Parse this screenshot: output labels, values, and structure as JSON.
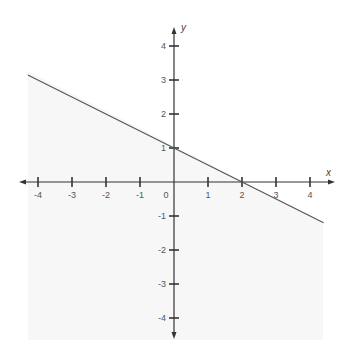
{
  "chart_data": {
    "type": "line",
    "title": "",
    "xlabel": "x",
    "ylabel": "y",
    "xlim": [
      -4.5,
      4.5
    ],
    "ylim": [
      -4.5,
      4.5
    ],
    "grid": false,
    "x_ticks": [
      "-4",
      "-3",
      "-2",
      "-1",
      "0",
      "1",
      "2",
      "3",
      "4"
    ],
    "y_ticks": [
      "4",
      "3",
      "2",
      "1",
      "-1",
      "-2",
      "-3",
      "-4"
    ],
    "series": [
      {
        "name": "y = 1 - x/2",
        "equation": "y = -0.5x + 1",
        "x": [
          -4.3,
          4.4
        ],
        "values": [
          3.15,
          -1.2
        ],
        "color": "#555555"
      }
    ],
    "shaded_region": "below line (very light gray)",
    "axis_color": "#333333"
  }
}
